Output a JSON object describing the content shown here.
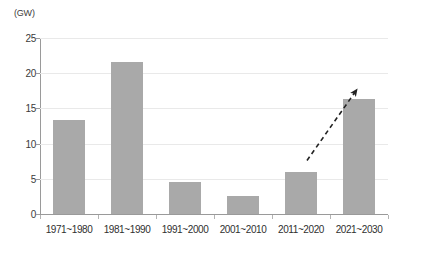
{
  "chart_data": {
    "type": "bar",
    "title": "",
    "subtitle": "",
    "xlabel": "",
    "ylabel": "(GW)",
    "unit_label": "(GW)",
    "categories": [
      "1971~1980",
      "1981~1990",
      "1991~2000",
      "2001~2010",
      "2011~2020",
      "2021~2030"
    ],
    "values": [
      13.3,
      21.6,
      4.6,
      2.6,
      6.0,
      16.3
    ],
    "ylim": [
      0,
      25
    ],
    "ytick_labels": [
      "0",
      "5",
      "10",
      "15",
      "20",
      "25"
    ],
    "ytick_values": [
      0,
      5,
      10,
      15,
      20,
      25
    ],
    "grid": true,
    "legend": "none",
    "bar_color": "#a9a9a9",
    "grid_color": "#e9e9e9",
    "axis_color": "#9a9a9a",
    "annotations": [
      {
        "type": "arrow",
        "style": "dashed",
        "color": "#222222",
        "label": "",
        "from_category": "2011~2020",
        "to_category": "2021~2030",
        "from_value": 7.6,
        "to_value": 17.3
      }
    ]
  }
}
